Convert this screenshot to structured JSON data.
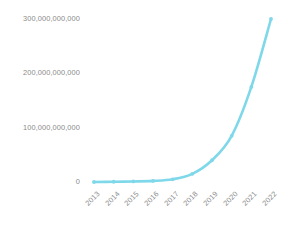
{
  "chart_data": {
    "type": "line",
    "title": "",
    "subtitle": "",
    "xlabel": "",
    "ylabel": "",
    "categories": [
      "2013",
      "2014",
      "2015",
      "2016",
      "2017",
      "2018",
      "2019",
      "2020",
      "2021",
      "2022"
    ],
    "series": [
      {
        "name": "",
        "values": [
          0,
          500000000,
          1000000000,
          2000000000,
          5000000000,
          15000000000,
          40000000000,
          85000000000,
          175000000000,
          300000000000
        ],
        "color": "#7fd8ea",
        "marker": "circle"
      }
    ],
    "ylim": [
      0,
      300000000000
    ],
    "y_ticks": [
      0,
      100000000000,
      200000000000,
      300000000000
    ],
    "y_tick_labels": [
      "0",
      "100,000,000,000",
      "200,000,000,000",
      "300,000,000,000"
    ],
    "x_tick_labels": [
      "2013",
      "2014",
      "2015",
      "2016",
      "2017",
      "2018",
      "2019",
      "2020",
      "2021",
      "2022"
    ],
    "grid": false,
    "legend": false,
    "legend_position": "none",
    "background_color": "#ffffff",
    "tick_label_color": "#8a8a8a",
    "x_tick_rotation": -45
  }
}
